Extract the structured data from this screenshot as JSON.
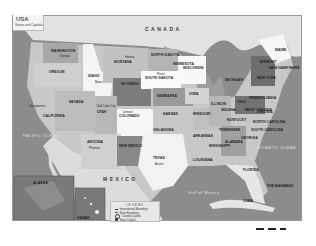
{
  "map": {
    "title": "USA",
    "subtitle": "States and Capitals",
    "countries": [
      "CANADA",
      "MEXICO",
      "CUBA"
    ],
    "water_bodies": [
      "PACIFIC OCEAN",
      "ATLANTIC OCEAN",
      "Gulf of Mexico"
    ],
    "states": [
      {
        "name": "WASHINGTON",
        "capital": "Olympia"
      },
      {
        "name": "OREGON",
        "capital": "Salem"
      },
      {
        "name": "CALIFORNIA",
        "capital": "Sacramento"
      },
      {
        "name": "IDAHO",
        "capital": "Boise"
      },
      {
        "name": "NEVADA",
        "capital": "Carson City"
      },
      {
        "name": "MONTANA",
        "capital": "Helena"
      },
      {
        "name": "WYOMING",
        "capital": "Cheyenne"
      },
      {
        "name": "UTAH",
        "capital": "Salt Lake City"
      },
      {
        "name": "ARIZONA",
        "capital": "Phoenix"
      },
      {
        "name": "COLORADO",
        "capital": "Denver"
      },
      {
        "name": "NEW MEXICO",
        "capital": "Santa Fe"
      },
      {
        "name": "NORTH DAKOTA",
        "capital": "Bismarck"
      },
      {
        "name": "SOUTH DAKOTA",
        "capital": "Pierre"
      },
      {
        "name": "NEBRASKA",
        "capital": "Lincoln"
      },
      {
        "name": "KANSAS",
        "capital": "Topeka"
      },
      {
        "name": "OKLAHOMA",
        "capital": "Oklahoma City"
      },
      {
        "name": "TEXAS",
        "capital": "Austin"
      },
      {
        "name": "MINNESOTA",
        "capital": "St. Paul"
      },
      {
        "name": "IOWA",
        "capital": "Des Moines"
      },
      {
        "name": "MISSOURI",
        "capital": "Jefferson City"
      },
      {
        "name": "ARKANSAS",
        "capital": "Little Rock"
      },
      {
        "name": "LOUISIANA",
        "capital": "Baton Rouge"
      },
      {
        "name": "WISCONSIN",
        "capital": "Madison"
      },
      {
        "name": "ILLINOIS",
        "capital": "Springfield"
      },
      {
        "name": "MICHIGAN",
        "capital": "Lansing"
      },
      {
        "name": "INDIANA",
        "capital": "Indianapolis"
      },
      {
        "name": "OHIO",
        "capital": "Columbus"
      },
      {
        "name": "KENTUCKY",
        "capital": "Frankfort"
      },
      {
        "name": "TENNESSEE",
        "capital": "Nashville"
      },
      {
        "name": "MISSISSIPPI",
        "capital": "Jackson"
      },
      {
        "name": "ALABAMA",
        "capital": "Montgomery"
      },
      {
        "name": "GEORGIA",
        "capital": "Atlanta"
      },
      {
        "name": "FLORIDA",
        "capital": "Tallahassee"
      },
      {
        "name": "SOUTH CAROLINA",
        "capital": "Columbia"
      },
      {
        "name": "NORTH CAROLINA",
        "capital": "Raleigh"
      },
      {
        "name": "VIRGINIA",
        "capital": "Richmond"
      },
      {
        "name": "WEST VIRGINIA",
        "capital": "Charleston"
      },
      {
        "name": "PENNSYLVANIA",
        "capital": "Harrisburg"
      },
      {
        "name": "NEW YORK",
        "capital": "Albany"
      },
      {
        "name": "MAINE",
        "capital": "Augusta"
      },
      {
        "name": "VERMONT",
        "capital": "Montpelier"
      },
      {
        "name": "NEW HAMPSHIRE",
        "capital": "Concord"
      },
      {
        "name": "ALASKA",
        "capital": "Juneau"
      },
      {
        "name": "HAWAII",
        "capital": "Honolulu"
      }
    ],
    "other_places": [
      "THE BAHAMAS"
    ],
    "legend": {
      "title": "LEGEND",
      "items": [
        {
          "label": "International Boundary",
          "symbol": "line"
        },
        {
          "label": "State Boundary",
          "symbol": "dashed"
        },
        {
          "label": "Country Capital",
          "symbol": "circle"
        },
        {
          "label": "State Capital",
          "symbol": "dot"
        }
      ]
    },
    "colors": {
      "water": "#8c8c8c",
      "land_light": "#eeeeee",
      "land_mid": "#b0b0b0",
      "land_dark": "#777777"
    }
  }
}
